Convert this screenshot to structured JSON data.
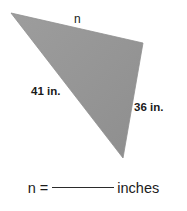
{
  "figure": {
    "shape": "triangle",
    "fill_color": "#979797",
    "stroke_color": "#8c8c8c",
    "background_color": "#ffffff",
    "vertices": [
      {
        "name": "left-vertex",
        "x": 11,
        "y": 13
      },
      {
        "name": "top-right-vertex",
        "x": 143,
        "y": 43
      },
      {
        "name": "bottom-vertex",
        "x": 123,
        "y": 158
      }
    ],
    "side_labels": {
      "top": "n",
      "left": "41 in.",
      "right": "36 in."
    }
  },
  "answer": {
    "variable_label": "n =",
    "blank": "",
    "unit_label": "inches",
    "full_text": "n = ________ inches"
  }
}
